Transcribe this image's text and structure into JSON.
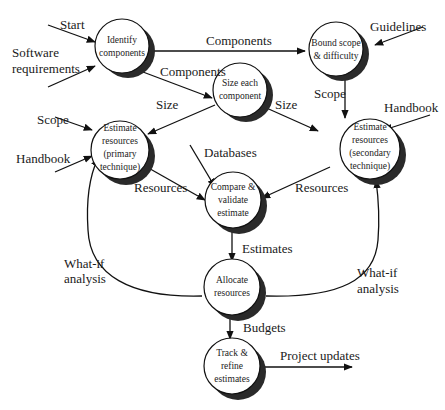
{
  "diagram": {
    "type": "data-flow",
    "nodes": [
      {
        "id": "identify",
        "lines": [
          "Identify",
          "components"
        ]
      },
      {
        "id": "bound",
        "lines": [
          "Bound scope",
          "& difficulty"
        ]
      },
      {
        "id": "size",
        "lines": [
          "Size each",
          "component"
        ]
      },
      {
        "id": "primary",
        "lines": [
          "Estimate",
          "resources",
          "(primary",
          "technique)"
        ]
      },
      {
        "id": "secondary",
        "lines": [
          "Estimate",
          "resources",
          "(secondary",
          "technique)"
        ]
      },
      {
        "id": "compare",
        "lines": [
          "Compare &",
          "validate",
          "estimate"
        ]
      },
      {
        "id": "allocate",
        "lines": [
          "Allocate",
          "resources"
        ]
      },
      {
        "id": "track",
        "lines": [
          "Track &",
          "refine",
          "estimates"
        ]
      }
    ],
    "labels": {
      "start": "Start",
      "software_requirements_1": "Software",
      "software_requirements_2": "requirements",
      "components_top": "Components",
      "components_mid": "Components",
      "guidelines": "Guidelines",
      "scope_left": "Scope",
      "scope_right": "Scope",
      "size_left": "Size",
      "size_right": "Size",
      "handbook_left": "Handbook",
      "handbook_right": "Handbook",
      "databases": "Databases",
      "resources_left": "Resources",
      "resources_right": "Resources",
      "estimates": "Estimates",
      "whatif_left_1": "What-if",
      "whatif_left_2": "analysis",
      "whatif_right_1": "What-if",
      "whatif_right_2": "analysis",
      "budgets": "Budgets",
      "project_updates": "Project updates"
    }
  }
}
